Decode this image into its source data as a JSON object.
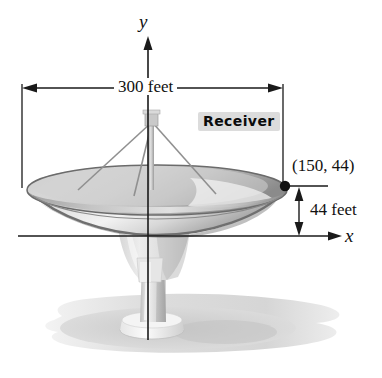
{
  "figure": {
    "axes": {
      "x_label": "x",
      "y_label": "y"
    },
    "labels": {
      "width_dimension": "300 feet",
      "height_dimension": "44 feet",
      "receiver": "Receiver",
      "rim_point": "(150, 44)"
    },
    "colors": {
      "ink": "#1a1a1a",
      "dish_light": "#e8e8e8",
      "dish_mid": "#b8b8b8",
      "dish_dark": "#8f8f8f",
      "shadow": "#d9d9d9",
      "highlight_box": "#dcdcdc",
      "background": "#ffffff"
    },
    "geometry": {
      "dish_diameter_feet": 300,
      "rim_height_feet": 44,
      "rim_point_x_feet": 150,
      "rim_point_y_feet": 44
    }
  }
}
